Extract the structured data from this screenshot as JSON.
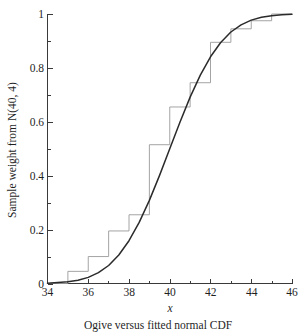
{
  "figure": {
    "caption": "Ogive versus fitted normal CDF",
    "xlabel": "x",
    "ylabel": "Sample weight from N(40, 4)"
  },
  "colors": {
    "ogive": "#9a9a9a",
    "cdf": "#2b2b2b",
    "axis": "#3a3a3a",
    "text": "#1f1f1f",
    "background": "#ffffff"
  },
  "axis": {
    "x_ticks": [
      "34",
      "36",
      "38",
      "40",
      "42",
      "44",
      "46"
    ],
    "y_ticks": [
      "0",
      "0.2",
      "0.4",
      "0.6",
      "0.8",
      "1"
    ]
  },
  "chart_data": {
    "type": "line",
    "title": "Ogive versus fitted normal CDF",
    "xlabel": "x",
    "ylabel": "Sample weight from N(40, 4)",
    "xlim": [
      34,
      46
    ],
    "ylim": [
      0,
      1
    ],
    "xticks": [
      34,
      36,
      38,
      40,
      42,
      44,
      46
    ],
    "yticks": [
      0,
      0.2,
      0.4,
      0.6,
      0.8,
      1
    ],
    "grid": false,
    "legend": null,
    "series": [
      {
        "name": "Ogive (empirical step function)",
        "type": "step",
        "color": "#9a9a9a",
        "step_edges": [
          34,
          35,
          36,
          37,
          38,
          39,
          40,
          41,
          42,
          43,
          44,
          45,
          46
        ],
        "step_values": [
          0.0,
          0.045,
          0.1,
          0.195,
          0.255,
          0.515,
          0.655,
          0.745,
          0.895,
          0.945,
          0.975,
          1.0,
          1.0
        ]
      },
      {
        "name": "Fitted normal CDF N(40, 4)",
        "type": "line",
        "color": "#2b2b2b",
        "distribution": "normal",
        "mean": 40,
        "variance": 4,
        "sd": 2,
        "x": [
          34,
          34.5,
          35,
          35.5,
          36,
          36.5,
          37,
          37.5,
          38,
          38.5,
          39,
          39.5,
          40,
          40.5,
          41,
          41.5,
          42,
          42.5,
          43,
          43.5,
          44,
          44.5,
          45,
          45.5,
          46
        ],
        "y": [
          0.0013,
          0.004,
          0.0062,
          0.0122,
          0.0228,
          0.0401,
          0.0668,
          0.1056,
          0.1587,
          0.2266,
          0.3085,
          0.4013,
          0.5,
          0.5987,
          0.6915,
          0.7734,
          0.8413,
          0.8944,
          0.9332,
          0.9599,
          0.9772,
          0.9878,
          0.9938,
          0.997,
          0.9987
        ]
      }
    ]
  }
}
